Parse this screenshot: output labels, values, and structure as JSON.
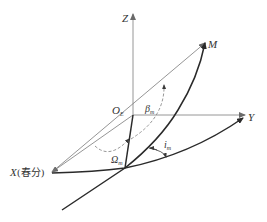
{
  "diagram": {
    "title": "",
    "labels": {
      "z_axis": "Z",
      "y_axis": "Y",
      "x_axis": "X(春分)",
      "x_axis_letter": "X",
      "x_axis_note": "(春分)",
      "origin": "O",
      "origin_sub": "E",
      "point_m": "M",
      "beta": "β",
      "beta_sub": "m",
      "omega": "Ω",
      "omega_sub": "m",
      "inclination": "i",
      "inclination_sub": "m"
    },
    "colors": {
      "axis": "#8a8a8a",
      "curve": "#2a2a2a",
      "text": "#333333",
      "background": "#ffffff"
    },
    "elements": [
      "Z axis (vertical arrow)",
      "Y axis (horizontal arrow)",
      "X axis toward vernal equinox",
      "Vector O_E to M",
      "Orbit great-circle arc through node and M",
      "Reference plane curve from X through node to Y",
      "Dashed angle arc beta_m",
      "Dashed angle arc Omega_m",
      "Inclination angle arc i_m"
    ]
  }
}
